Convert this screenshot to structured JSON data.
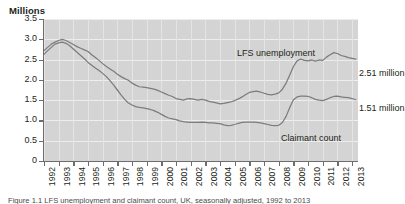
{
  "figure": {
    "y_axis_title": "Millions",
    "caption": "Figure 1.1  LFS unemployment and claimant count, UK, seasonally adjusted, 1992 to 2013"
  },
  "axes": {
    "y_ticks": [
      "3.5",
      "3.0",
      "2.5",
      "2.0",
      "1.5",
      "1.0",
      "0.5",
      "0"
    ],
    "y_values": [
      3.5,
      3.0,
      2.5,
      2.0,
      1.5,
      1.0,
      0.5,
      0
    ],
    "x_ticks": [
      "1992",
      "1993",
      "1994",
      "1995",
      "1996",
      "1997",
      "1998",
      "1999",
      "2000",
      "2001",
      "2002",
      "2003",
      "2004",
      "2005",
      "2006",
      "2007",
      "2008",
      "2009",
      "2010",
      "2011",
      "2012",
      "2013"
    ]
  },
  "annotations": {
    "lfs_label": "LFS unemployment",
    "claimant_label": "Claimant count",
    "lfs_value": "2.51 million",
    "claimant_value": "1.51 million"
  },
  "colors": {
    "plot_background": "#d4d4d4",
    "gridline": "#ededed",
    "series_line": "#7c7c7c",
    "axis": "#6d6d6d",
    "text": "#231f20"
  },
  "chart_data": {
    "type": "line",
    "title": "",
    "xlabel": "",
    "ylabel": "Millions",
    "ylim": [
      0,
      3.5
    ],
    "xlim": [
      1992,
      2013.4
    ],
    "grid": true,
    "legend": "inline-annotations",
    "x": [
      1992.0,
      1992.25,
      1992.5,
      1992.75,
      1993.0,
      1993.25,
      1993.5,
      1993.75,
      1994.0,
      1994.25,
      1994.5,
      1994.75,
      1995.0,
      1995.25,
      1995.5,
      1995.75,
      1996.0,
      1996.25,
      1996.5,
      1996.75,
      1997.0,
      1997.25,
      1997.5,
      1997.75,
      1998.0,
      1998.25,
      1998.5,
      1998.75,
      1999.0,
      1999.25,
      1999.5,
      1999.75,
      2000.0,
      2000.25,
      2000.5,
      2000.75,
      2001.0,
      2001.25,
      2001.5,
      2001.75,
      2002.0,
      2002.25,
      2002.5,
      2002.75,
      2003.0,
      2003.25,
      2003.5,
      2003.75,
      2004.0,
      2004.25,
      2004.5,
      2004.75,
      2005.0,
      2005.25,
      2005.5,
      2005.75,
      2006.0,
      2006.25,
      2006.5,
      2006.75,
      2007.0,
      2007.25,
      2007.5,
      2007.75,
      2008.0,
      2008.25,
      2008.5,
      2008.75,
      2009.0,
      2009.25,
      2009.5,
      2009.75,
      2010.0,
      2010.25,
      2010.5,
      2010.75,
      2011.0,
      2011.25,
      2011.5,
      2011.75,
      2012.0,
      2012.25,
      2012.5,
      2012.75,
      2013.0,
      2013.25
    ],
    "series": [
      {
        "name": "LFS unemployment",
        "end_value": 2.51,
        "values": [
          2.72,
          2.8,
          2.88,
          2.93,
          2.97,
          3.0,
          2.97,
          2.92,
          2.87,
          2.82,
          2.78,
          2.74,
          2.7,
          2.62,
          2.55,
          2.48,
          2.4,
          2.33,
          2.27,
          2.21,
          2.14,
          2.08,
          2.03,
          1.99,
          1.92,
          1.87,
          1.83,
          1.82,
          1.81,
          1.79,
          1.77,
          1.74,
          1.7,
          1.66,
          1.62,
          1.59,
          1.54,
          1.52,
          1.5,
          1.53,
          1.54,
          1.52,
          1.5,
          1.52,
          1.5,
          1.47,
          1.45,
          1.43,
          1.41,
          1.42,
          1.44,
          1.46,
          1.49,
          1.53,
          1.58,
          1.64,
          1.69,
          1.71,
          1.72,
          1.7,
          1.67,
          1.64,
          1.63,
          1.65,
          1.68,
          1.77,
          1.92,
          2.12,
          2.33,
          2.47,
          2.51,
          2.48,
          2.47,
          2.49,
          2.46,
          2.49,
          2.48,
          2.56,
          2.62,
          2.67,
          2.65,
          2.6,
          2.58,
          2.55,
          2.53,
          2.51
        ]
      },
      {
        "name": "Claimant count",
        "end_value": 1.51,
        "values": [
          2.63,
          2.72,
          2.8,
          2.88,
          2.91,
          2.93,
          2.9,
          2.84,
          2.76,
          2.68,
          2.6,
          2.52,
          2.43,
          2.36,
          2.29,
          2.23,
          2.16,
          2.08,
          1.98,
          1.87,
          1.75,
          1.63,
          1.52,
          1.43,
          1.38,
          1.34,
          1.32,
          1.31,
          1.29,
          1.27,
          1.24,
          1.2,
          1.15,
          1.1,
          1.06,
          1.04,
          1.02,
          0.99,
          0.97,
          0.96,
          0.95,
          0.95,
          0.95,
          0.96,
          0.95,
          0.94,
          0.94,
          0.93,
          0.92,
          0.89,
          0.87,
          0.88,
          0.9,
          0.93,
          0.95,
          0.96,
          0.96,
          0.96,
          0.95,
          0.94,
          0.92,
          0.9,
          0.88,
          0.87,
          0.88,
          0.95,
          1.1,
          1.32,
          1.51,
          1.58,
          1.6,
          1.6,
          1.59,
          1.56,
          1.52,
          1.5,
          1.49,
          1.52,
          1.56,
          1.59,
          1.6,
          1.58,
          1.57,
          1.56,
          1.54,
          1.51
        ]
      }
    ]
  }
}
